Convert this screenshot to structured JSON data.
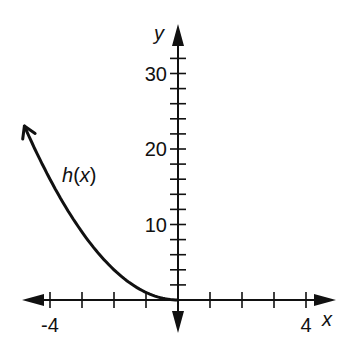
{
  "chart_data": {
    "type": "line",
    "title": "",
    "xlabel": "x",
    "ylabel": "y",
    "xlim": [
      -4.8,
      4.6
    ],
    "ylim": [
      0,
      33
    ],
    "x_ticks": [
      -4,
      -3,
      -2,
      -1,
      1,
      2,
      3,
      4
    ],
    "x_tick_labels": [
      {
        "value": -4,
        "text": "-4"
      },
      {
        "value": 4,
        "text": "4"
      }
    ],
    "y_ticks": [
      2,
      4,
      6,
      8,
      10,
      12,
      14,
      16,
      18,
      20,
      22,
      24,
      26,
      28,
      30,
      32
    ],
    "y_tick_labels": [
      {
        "value": 10,
        "text": "10"
      },
      {
        "value": 20,
        "text": "20"
      },
      {
        "value": 30,
        "text": "30"
      }
    ],
    "series": [
      {
        "name": "h(x)",
        "label": "h(x)",
        "function": "x^2",
        "domain": [
          -4.8,
          0
        ],
        "arrow_at": "left",
        "x": [
          -4.8,
          -4,
          -3,
          -2,
          -1,
          0
        ],
        "y": [
          23,
          16,
          9,
          4,
          1,
          0
        ]
      }
    ],
    "grid": false,
    "color": "#111111"
  }
}
